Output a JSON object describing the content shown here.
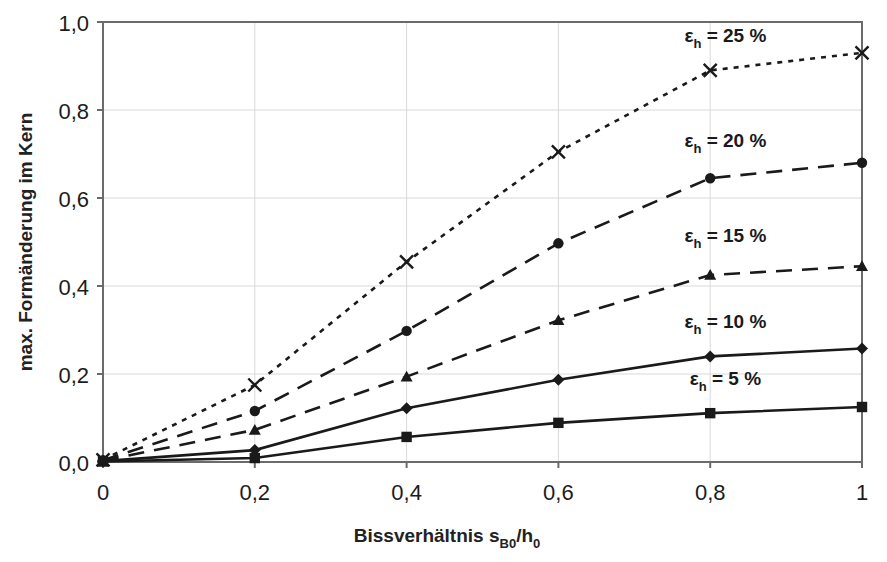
{
  "chart_data": {
    "type": "line",
    "title": "",
    "xlabel": "Bissverhältnis s_B0/h_0",
    "xlabel_parts": {
      "main": "Bissverhältnis s",
      "sub1": "B0",
      "mid": "/h",
      "sub2": "0"
    },
    "ylabel": "max. Formänderung im Kern",
    "x": [
      0,
      0.2,
      0.4,
      0.6,
      0.8,
      1.0
    ],
    "xlim": [
      0,
      1
    ],
    "ylim": [
      0,
      1
    ],
    "xticks": [
      "0",
      "0,2",
      "0,4",
      "0,6",
      "0,8",
      "1"
    ],
    "xtick_values": [
      0,
      0.2,
      0.4,
      0.6,
      0.8,
      1.0
    ],
    "yticks": [
      "0,0",
      "0,2",
      "0,4",
      "0,6",
      "0,8",
      "1,0"
    ],
    "ytick_values": [
      0,
      0.2,
      0.4,
      0.6,
      0.8,
      1.0
    ],
    "grid": true,
    "grid_color": "#d9d9d9",
    "legend": "inline-annotations",
    "line_color": "#1a1a1a",
    "series": [
      {
        "name": "eps_h = 25 %",
        "label_main": "ε",
        "label_sub": "h",
        "label_rest": " = 25 %",
        "marker": "x",
        "dash": "dotted",
        "values": [
          0.005,
          0.175,
          0.455,
          0.705,
          0.89,
          0.93
        ]
      },
      {
        "name": "eps_h = 20 %",
        "label_main": "ε",
        "label_sub": "h",
        "label_rest": " = 20 %",
        "marker": "circle",
        "dash": "dashed-long",
        "values": [
          0.004,
          0.116,
          0.298,
          0.497,
          0.645,
          0.68
        ]
      },
      {
        "name": "eps_h = 15 %",
        "label_main": "ε",
        "label_sub": "h",
        "label_rest": " = 15 %",
        "marker": "triangle",
        "dash": "dashed-long",
        "values": [
          0.003,
          0.073,
          0.194,
          0.322,
          0.425,
          0.445
        ]
      },
      {
        "name": "eps_h = 10 %",
        "label_main": "ε",
        "label_sub": "h",
        "label_rest": " = 10 %",
        "marker": "diamond",
        "dash": "solid",
        "values": [
          0.002,
          0.027,
          0.122,
          0.187,
          0.24,
          0.258
        ]
      },
      {
        "name": "eps_h = 5 %",
        "label_main": "ε",
        "label_sub": "h",
        "label_rest": " = 5 %",
        "marker": "square",
        "dash": "solid",
        "values": [
          0.001,
          0.009,
          0.057,
          0.089,
          0.111,
          0.125
        ]
      }
    ],
    "annotations": [
      {
        "text": "εh = 25 %",
        "x": 0.82,
        "y": 0.955
      },
      {
        "text": "εh = 20 %",
        "x": 0.82,
        "y": 0.715
      },
      {
        "text": "εh = 15 %",
        "x": 0.82,
        "y": 0.5
      },
      {
        "text": "εh = 10 %",
        "x": 0.82,
        "y": 0.305
      },
      {
        "text": "εh = 5 %",
        "x": 0.82,
        "y": 0.175
      }
    ]
  }
}
